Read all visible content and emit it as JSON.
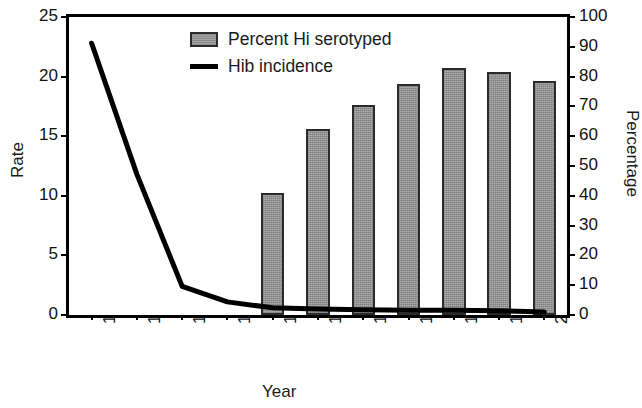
{
  "chart_data": {
    "type": "bar",
    "title": "",
    "subtitle": "",
    "xlabel": "Year",
    "ylabel": "Rate",
    "y2label": "Percentage",
    "categories": [
      "1990",
      "1991",
      "1992",
      "1993",
      "1994",
      "1995",
      "1996",
      "1997",
      "1998",
      "1999",
      "2000"
    ],
    "ylim": [
      0,
      25
    ],
    "yticks": [
      "0",
      "5",
      "10",
      "15",
      "20",
      "25"
    ],
    "y2lim": [
      0,
      100
    ],
    "y2ticks": [
      "0",
      "10",
      "20",
      "30",
      "40",
      "50",
      "60",
      "70",
      "80",
      "90",
      "100"
    ],
    "grid": false,
    "legend_position": "top-center",
    "series": [
      {
        "name": "Percent Hi serotyped",
        "type": "bar",
        "axis": "right",
        "units": "percent",
        "color": "#9a9a9a",
        "edge_color": "#2b2b2b",
        "values": [
          null,
          null,
          null,
          null,
          41,
          62.5,
          70.5,
          77.5,
          83,
          81.5,
          78.5
        ]
      },
      {
        "name": "Hib incidence",
        "type": "line",
        "axis": "left",
        "units": "rate",
        "color": "#000000",
        "values": [
          22.8,
          11.8,
          2.4,
          1.1,
          0.6,
          0.5,
          0.45,
          0.4,
          0.4,
          0.35,
          0.25
        ]
      }
    ]
  },
  "legend": {
    "items": [
      {
        "label": "Percent Hi serotyped",
        "marker": "bar-swatch-icon"
      },
      {
        "label": "Hib incidence",
        "marker": "line-swatch-icon"
      }
    ]
  }
}
